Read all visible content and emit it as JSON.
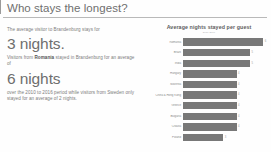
{
  "header": {
    "title": "Who stays the longest?"
  },
  "narrative": {
    "intro": "The average visitor to Brandenburg stays for",
    "stat_one": "3 nights.",
    "lead_in_prefix": "Visitors from ",
    "lead_in_bold": "Romania",
    "lead_in_suffix": " stayed in Brandenburg for an average of",
    "stat_two": "6 nights",
    "outro": "over the 2010 to 2016 period while visitors from Sweden only stayed for an average of 2 nights."
  },
  "chart_data": {
    "type": "bar",
    "orientation": "horizontal",
    "title": "Average nights stayed per guest",
    "subtitle": "2010-2016",
    "xlabel": "",
    "ylabel": "",
    "xlim": [
      0,
      6.5
    ],
    "grid": false,
    "legend": "none",
    "bar_color": "#787878",
    "categories": [
      "Romania",
      "Brazil",
      "India",
      "Hungary",
      "Slovenia",
      "China & Hong Kong",
      "Greece",
      "Bulgaria",
      "Croatia",
      "Poland"
    ],
    "values": [
      6,
      5,
      5,
      4,
      4,
      4,
      4,
      4,
      4,
      3
    ],
    "value_labels": [
      "6",
      "5",
      "5",
      "4",
      "4",
      "4",
      "4",
      "4",
      "4",
      "3"
    ]
  }
}
